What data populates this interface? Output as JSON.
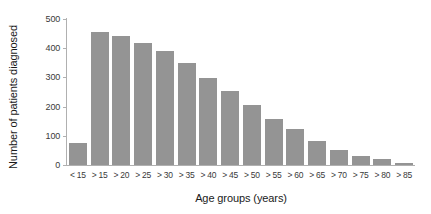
{
  "chart_data": {
    "type": "bar",
    "title": "",
    "xlabel": "Age groups (years)",
    "ylabel": "Number of patients diagnosed",
    "categories": [
      "< 15",
      "> 15",
      "> 20",
      "> 25",
      "> 30",
      "> 35",
      "> 40",
      "> 45",
      "> 50",
      "> 55",
      "> 60",
      "> 65",
      "> 70",
      "> 75",
      "> 80",
      "> 85"
    ],
    "values": [
      76,
      455,
      442,
      419,
      390,
      349,
      299,
      252,
      205,
      159,
      122,
      82,
      53,
      31,
      19,
      8
    ],
    "ylim": [
      0,
      500
    ],
    "yticks": [
      0,
      100,
      200,
      300,
      400,
      500
    ],
    "ytick_labels": [
      "0",
      "100",
      "200",
      "300",
      "400",
      "500"
    ],
    "grid": false,
    "legend": false,
    "bar_color": "#949494",
    "axis_color": "#b0b0b0",
    "background": "#ffffff"
  }
}
